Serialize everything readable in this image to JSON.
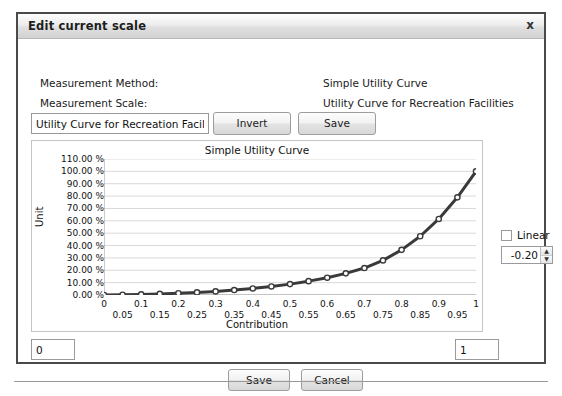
{
  "window": {
    "title": "Edit current scale",
    "close_icon": "close-icon",
    "close_label": "x"
  },
  "fields": {
    "measurement_method_label": "Measurement Method:",
    "measurement_method_value": "Simple Utility Curve",
    "measurement_scale_label": "Measurement Scale:",
    "measurement_scale_value": "Utility Curve for Recreation Facilities"
  },
  "toolbar": {
    "name_value": "Utility Curve for Recreation Facil",
    "invert_label": "Invert",
    "save_label": "Save"
  },
  "controls": {
    "linear_label": "Linear",
    "linear_checked": false,
    "exponent_value": "-0.20",
    "spin_up": "▲",
    "spin_down": "▼"
  },
  "range": {
    "min_value": "0",
    "max_value": "1"
  },
  "footer": {
    "save_label": "Save",
    "cancel_label": "Cancel"
  },
  "chart_data": {
    "type": "line",
    "title": "Simple Utility Curve",
    "xlabel": "Contribution",
    "ylabel": "Unit",
    "xlim": [
      0,
      1
    ],
    "ylim": [
      0,
      1.1
    ],
    "grid": true,
    "legend": "none",
    "series_color": "#3a3a3a",
    "marker": "open-circle",
    "ytick_labels": [
      "0.00 %",
      "10.00 %",
      "20.00 %",
      "30.00 %",
      "40.00 %",
      "50.00 %",
      "60.00 %",
      "70.00 %",
      "80.00 %",
      "90.00 %",
      "100.00 %",
      "110.00 %"
    ],
    "ytick_values": [
      0,
      0.1,
      0.2,
      0.3,
      0.4,
      0.5,
      0.6,
      0.7,
      0.8,
      0.9,
      1.0,
      1.1
    ],
    "xtick_labels": [
      "0",
      "0.05",
      "0.1",
      "0.15",
      "0.2",
      "0.25",
      "0.3",
      "0.35",
      "0.4",
      "0.45",
      "0.5",
      "0.55",
      "0.6",
      "0.65",
      "0.7",
      "0.75",
      "0.8",
      "0.85",
      "0.9",
      "0.95",
      "1"
    ],
    "xtick_values": [
      0,
      0.05,
      0.1,
      0.15,
      0.2,
      0.25,
      0.3,
      0.35,
      0.4,
      0.45,
      0.5,
      0.55,
      0.6,
      0.65,
      0.7,
      0.75,
      0.8,
      0.85,
      0.9,
      0.95,
      1
    ],
    "x": [
      0,
      0.05,
      0.1,
      0.15,
      0.2,
      0.25,
      0.3,
      0.35,
      0.4,
      0.45,
      0.5,
      0.55,
      0.6,
      0.65,
      0.7,
      0.75,
      0.8,
      0.85,
      0.9,
      0.95,
      1
    ],
    "y": [
      0.0,
      0.002,
      0.005,
      0.009,
      0.014,
      0.021,
      0.029,
      0.04,
      0.053,
      0.069,
      0.088,
      0.112,
      0.14,
      0.175,
      0.218,
      0.28,
      0.365,
      0.475,
      0.615,
      0.79,
      1.0
    ]
  }
}
